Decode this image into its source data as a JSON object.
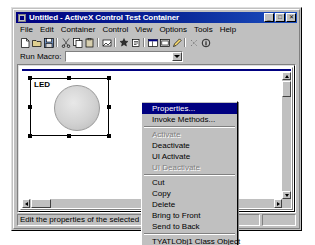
{
  "window": {
    "title": "Untitled - ActiveX Control Test Container",
    "icon": "app-icon",
    "minimize_label": "_",
    "maximize_label": "□",
    "close_label": "✕"
  },
  "menubar": {
    "items": [
      {
        "label": "File"
      },
      {
        "label": "Edit"
      },
      {
        "label": "Container"
      },
      {
        "label": "Control"
      },
      {
        "label": "View"
      },
      {
        "label": "Options"
      },
      {
        "label": "Tools"
      },
      {
        "label": "Help"
      }
    ]
  },
  "toolbar": {
    "buttons": [
      {
        "name": "new-icon"
      },
      {
        "name": "open-icon"
      },
      {
        "name": "save-icon"
      },
      {
        "name": "cut-icon"
      },
      {
        "name": "copy-icon"
      },
      {
        "name": "paste-icon"
      },
      {
        "name": "insert-control-icon"
      },
      {
        "name": "new-control-icon"
      },
      {
        "name": "invoke-methods-icon"
      },
      {
        "name": "properties-icon"
      },
      {
        "name": "events-log-icon"
      },
      {
        "name": "edit-icon"
      },
      {
        "name": "test-icon"
      },
      {
        "name": "about-icon"
      }
    ]
  },
  "macrobar": {
    "label": "Run Macro:",
    "value": "",
    "placeholder": ""
  },
  "control": {
    "label": "LED",
    "shape": "circle"
  },
  "context_menu": {
    "items": [
      {
        "label": "Properties...",
        "state": "highlighted",
        "accel": "P"
      },
      {
        "label": "Invoke Methods...",
        "state": "normal",
        "accel": "M"
      },
      {
        "type": "separator"
      },
      {
        "label": "Activate",
        "state": "disabled"
      },
      {
        "label": "Deactivate",
        "state": "normal"
      },
      {
        "label": "UI Activate",
        "state": "normal"
      },
      {
        "label": "UI Deactivate",
        "state": "disabled"
      },
      {
        "type": "separator"
      },
      {
        "label": "Cut",
        "state": "normal"
      },
      {
        "label": "Copy",
        "state": "normal"
      },
      {
        "label": "Delete",
        "state": "normal"
      },
      {
        "label": "Bring to Front",
        "state": "normal"
      },
      {
        "label": "Send to Back",
        "state": "normal"
      },
      {
        "type": "separator"
      },
      {
        "label": "TYATLObj1 Class Object",
        "state": "normal"
      }
    ]
  },
  "statusbar": {
    "message": "Edit the properties of the selected control",
    "panes": [
      {
        "label": "Windowless"
      },
      {
        "label": ""
      },
      {
        "label": ""
      },
      {
        "label": ""
      }
    ]
  }
}
